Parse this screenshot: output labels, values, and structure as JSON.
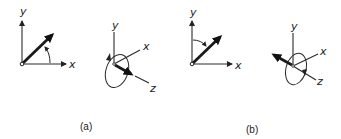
{
  "figure": {
    "panels": [
      {
        "caption": "(a)",
        "planar": {
          "y_label": "y",
          "x_label": "x"
        },
        "spatial": {
          "y_label": "y",
          "x_label": "x",
          "z_label": "z"
        }
      },
      {
        "caption": "(b)",
        "planar": {
          "y_label": "y",
          "x_label": "x"
        },
        "spatial": {
          "y_label": "y",
          "x_label": "x",
          "z_label": "z"
        }
      }
    ],
    "colors": {
      "ink": "#222222",
      "background": "#ffffff"
    }
  }
}
